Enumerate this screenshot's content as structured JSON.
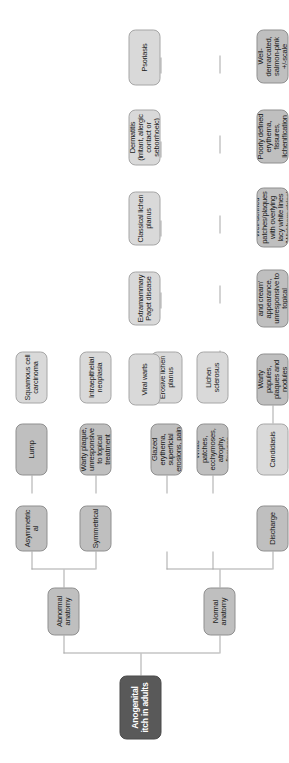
{
  "diagram": {
    "title": "Anogenital itch in adults",
    "type": "flowchart",
    "orientation": "rotated-90-ccw",
    "colors": {
      "root_fill": "#595959",
      "root_text": "#ffffff",
      "branch_fill": "#bfbfbf",
      "leaf_fill": "#d9d9d9",
      "connector": "#a8a8a8",
      "background": "#ffffff"
    },
    "root": {
      "label": "Anogenital itch in adults"
    },
    "level2": [
      {
        "id": "abnormal",
        "label": "Abnormal anatomy"
      },
      {
        "id": "normal",
        "label": "Normal anatomy"
      }
    ],
    "level3": [
      {
        "id": "asymmetrical",
        "label": "Asymmetrical",
        "parent": "abnormal"
      },
      {
        "id": "symmetrical",
        "label": "Symmetrical",
        "parent": "abnormal"
      },
      {
        "id": "discharge",
        "label": "Discharge",
        "parent": "normal"
      }
    ],
    "findings": [
      {
        "id": "lump",
        "label": "Lump",
        "parent": "asymmetrical"
      },
      {
        "id": "wartyplaque",
        "label": "Warty plaque, unresponsive to topical treatment",
        "parent": "asymmetrical"
      },
      {
        "id": "glazed",
        "label": "Glazed erythema, superficial erosions, pain",
        "parent": "symmetrical"
      },
      {
        "id": "whitepatches",
        "label": "White patches, ecchymoses, atrophy, fissures",
        "parent": "symmetrical"
      },
      {
        "id": "wartypapules",
        "label": "Warty papules, plaques and nodules",
        "parent": "normal"
      },
      {
        "id": "strawberries",
        "label": "Strawberries and cream' appearance, unresponsive to topical treatment",
        "parent": "normal"
      },
      {
        "id": "welldefined",
        "label": "Well-defined patches/plaques with overlying lacy white lines (Wickham striae)",
        "parent": "normal"
      },
      {
        "id": "poorlydefined",
        "label": "Poorly defined erythema, fissures, lichenification",
        "parent": "normal"
      },
      {
        "id": "welldemarcated",
        "label": "Well-demarcated, salmon-pink +/-scale",
        "parent": "normal"
      }
    ],
    "diagnoses": [
      {
        "id": "scc",
        "label": "Squamous cell carcinoma",
        "parent": "lump"
      },
      {
        "id": "vin",
        "label": "Intraepithelial neoplasia",
        "parent": "wartyplaque"
      },
      {
        "id": "elp",
        "label": "Erosive lichen planus",
        "parent": "glazed"
      },
      {
        "id": "ls",
        "label": "Lichen sclerosus",
        "parent": "whitepatches"
      },
      {
        "id": "candidiasis",
        "label": "Candidiasis",
        "parent": "discharge"
      },
      {
        "id": "viralwarts",
        "label": "Viral warts",
        "parent": "wartypapules"
      },
      {
        "id": "paget",
        "label": "Extramammary Paget disease",
        "parent": "strawberries"
      },
      {
        "id": "clp",
        "label": "Classical lichen planus",
        "parent": "welldefined"
      },
      {
        "id": "dermatitis",
        "label": "Dermatitis (irritant, allergic contact or seborrhoeic)",
        "parent": "poorlydefined"
      },
      {
        "id": "psoriasis",
        "label": "Psoriasis",
        "parent": "welldemarcated"
      }
    ]
  }
}
